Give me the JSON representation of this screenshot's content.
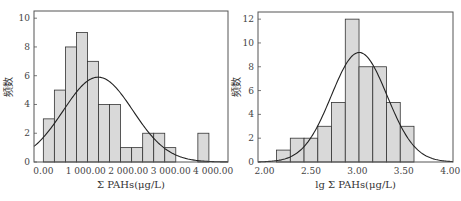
{
  "chart_data": [
    {
      "type": "bar",
      "subtype": "histogram_with_normal_curve",
      "title": "",
      "xlabel": "Σ PAHs(μg/L)",
      "ylabel": "频数",
      "xticks": [
        "0.00",
        "1 000.00",
        "2 000.00",
        "3 000.00",
        "4 000.00"
      ],
      "xtick_values": [
        0,
        1000,
        2000,
        3000,
        4000
      ],
      "yticks": [
        "0",
        "2",
        "4",
        "6",
        "8",
        "10"
      ],
      "ytick_values": [
        0,
        2,
        4,
        6,
        8,
        10
      ],
      "xlim": [
        -220,
        4350
      ],
      "ylim": [
        0,
        10.5
      ],
      "bin_start": 0,
      "bin_width": 260,
      "values": [
        3,
        5,
        8,
        9,
        7,
        4,
        4,
        1,
        1,
        2,
        2,
        1,
        0,
        0,
        2
      ],
      "normal_curve": {
        "mean": 1290,
        "sd": 820,
        "peak": 5.9
      },
      "grid": false,
      "legend": null
    },
    {
      "type": "bar",
      "subtype": "histogram_with_normal_curve",
      "title": "",
      "xlabel": "lg Σ PAHs(μg/L)",
      "ylabel": "频数",
      "xticks": [
        "2.00",
        "2.50",
        "3.00",
        "3.50",
        "4.00"
      ],
      "xtick_values": [
        2.0,
        2.5,
        3.0,
        3.5,
        4.0
      ],
      "yticks": [
        "0",
        "2",
        "4",
        "6",
        "8",
        "10",
        "12"
      ],
      "ytick_values": [
        0,
        2,
        4,
        6,
        8,
        10,
        12
      ],
      "xlim": [
        1.93,
        4.03
      ],
      "ylim": [
        0,
        12.6
      ],
      "bin_start": 2.13,
      "bin_width": 0.148,
      "values": [
        1,
        2,
        2,
        3,
        5,
        12,
        8,
        8,
        5,
        3
      ],
      "normal_curve": {
        "mean": 3.02,
        "sd": 0.3,
        "peak": 9.2
      },
      "grid": false,
      "legend": null
    }
  ]
}
